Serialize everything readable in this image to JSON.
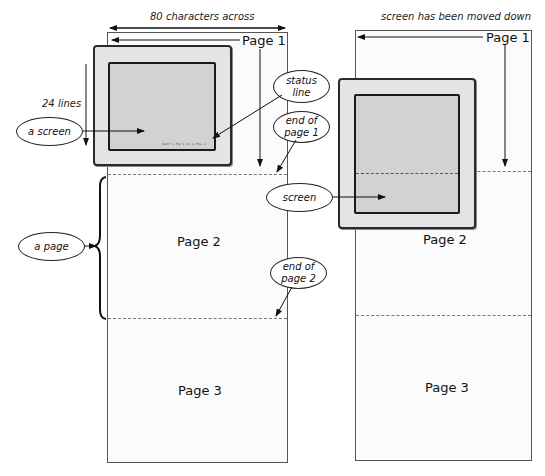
{
  "left_diagram": {
    "width_label": "80 characters across",
    "height_label": "24 lines",
    "pages": [
      {
        "label": "Page 1"
      },
      {
        "label": "Page 2"
      },
      {
        "label": "Page 3"
      }
    ],
    "callouts": {
      "a_screen": "a screen",
      "a_page": "a page",
      "status_line": "status\nline",
      "end_of_page_1": "end of\npage 1",
      "end_of_page_2": "end of\npage 2"
    },
    "status_line_text": "Sect 1  Pg 1  Ln 1    Pos 1"
  },
  "right_diagram": {
    "caption": "screen has been moved down",
    "pages": [
      {
        "label": "Page 1"
      },
      {
        "label": "Page 2"
      },
      {
        "label": "Page 3"
      }
    ],
    "callouts": {
      "screen": "screen"
    }
  },
  "colors": {
    "page_fill": "#fbfbfb",
    "monitor_bezel": "#e4e4e4",
    "screen_fill": "#d2d2d2",
    "line": "#222222"
  }
}
